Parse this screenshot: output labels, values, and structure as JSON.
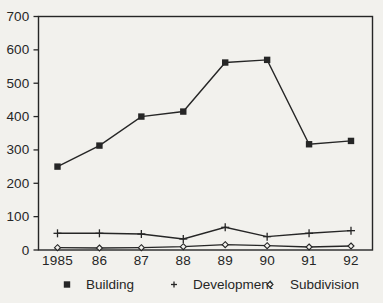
{
  "chart_data": {
    "type": "line",
    "title": "",
    "xlabel": "",
    "ylabel": "",
    "categories": [
      "1985",
      "86",
      "87",
      "88",
      "89",
      "90",
      "91",
      "92"
    ],
    "series": [
      {
        "name": "Building",
        "marker": "filled-square",
        "values": [
          250,
          313,
          400,
          415,
          562,
          570,
          317,
          327
        ]
      },
      {
        "name": "Development",
        "marker": "plus",
        "values": [
          50,
          50,
          48,
          33,
          68,
          40,
          50,
          58
        ]
      },
      {
        "name": "Subdivision",
        "marker": "open-diamond",
        "values": [
          7,
          6,
          7,
          10,
          16,
          13,
          9,
          12
        ]
      }
    ],
    "ylim": [
      0,
      700
    ],
    "yticks": [
      0,
      100,
      200,
      300,
      400,
      500,
      600,
      700
    ],
    "grid": false,
    "legend_position": "bottom",
    "colors": {
      "line": "#262626",
      "text": "#262626",
      "background": "#f2f1ed"
    }
  }
}
